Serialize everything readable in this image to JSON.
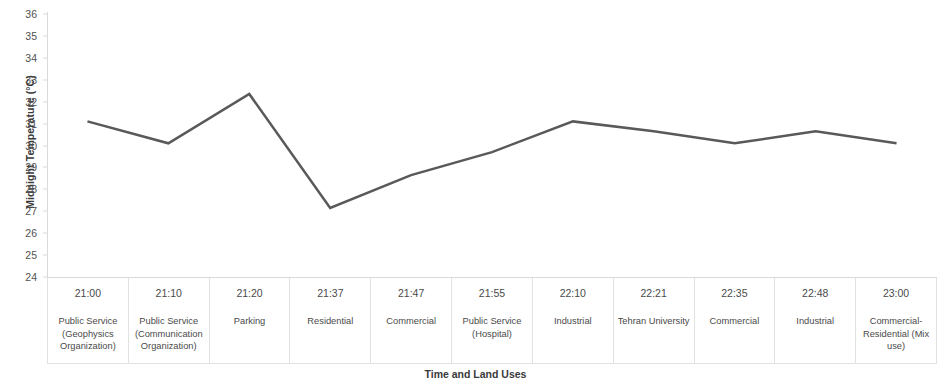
{
  "chart_data": {
    "type": "line",
    "title": "",
    "xlabel": "Time and Land Uses",
    "ylabel": "Midnight Temperature (°C)",
    "ylim": [
      24,
      36
    ],
    "yticks": [
      24,
      25,
      26,
      27,
      28,
      29,
      30,
      31,
      32,
      33,
      34,
      35,
      36
    ],
    "grid": false,
    "legend": "none",
    "line_color": "#595959",
    "line_width": 2.5,
    "categories": [
      "21:00",
      "21:10",
      "21:20",
      "21:37",
      "21:47",
      "21:55",
      "22:10",
      "22:21",
      "22:35",
      "22:48",
      "23:00"
    ],
    "category_sublabels": [
      "Public Service (Geophysics Organization)",
      "Public Service (Communication Organization)",
      "Parking",
      "Residential",
      "Commercial",
      "Public Service (Hospital)",
      "Industrial",
      "Tehran University",
      "Commercial",
      "Industrial",
      "Commercial-Residential (Mix use)"
    ],
    "values": [
      31.1,
      30.1,
      32.35,
      27.15,
      28.65,
      29.7,
      31.1,
      30.65,
      30.1,
      30.65,
      30.1
    ]
  },
  "axis": {
    "y_title": "Midnight Temperature (°C)",
    "x_title": "Time and Land Uses"
  }
}
